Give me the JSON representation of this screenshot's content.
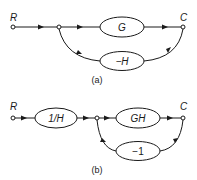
{
  "diagram_a": {
    "caption": "(a)",
    "input_label": "R",
    "output_label": "C",
    "forward_gain": "G",
    "feedback_gain": "−H"
  },
  "diagram_b": {
    "caption": "(b)",
    "input_label": "R",
    "output_label": "C",
    "prefilter_gain": "1/H",
    "forward_gain": "GH",
    "feedback_gain": "−1"
  },
  "colors": {
    "stroke": "#1a1a1a",
    "background": "#ffffff"
  }
}
